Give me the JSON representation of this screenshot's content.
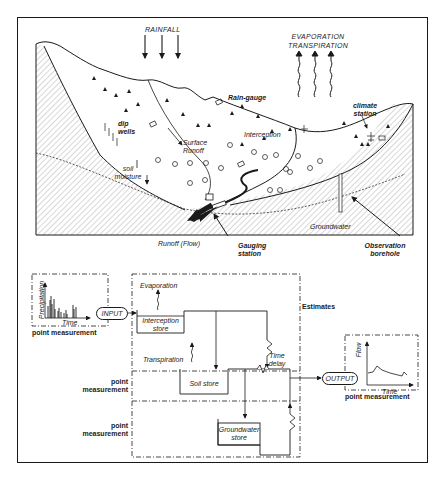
{
  "landscape": {
    "rainfall": "RAINFALL",
    "evaporation_line1": "EVAPORATION",
    "evaporation_line2": "TRANSPIRATION",
    "rain_gauge": "Rain-gauge",
    "climate_station_line1": "climate",
    "climate_station_line2": "station",
    "dip_wells_line1": "dip",
    "dip_wells_line2": "wells",
    "surface_runoff_line1": "Surface",
    "surface_runoff_line2": "Runoff",
    "interception": "Interception",
    "soil_moisture_line1": "soil",
    "soil_moisture_line2": "moisture",
    "groundwater": "Groundwater",
    "runoff_flow": "Runoff (Flow)",
    "gauging_station_line1": "Gauging",
    "gauging_station_line2": "station",
    "observation_borehole_line1": "Observation",
    "observation_borehole_line2": "borehole"
  },
  "model": {
    "input_panel": {
      "y_axis": "Precipitation",
      "x_axis": "Time",
      "caption": "point measurement"
    },
    "input_node": "INPUT",
    "estimates": "Estimates",
    "evaporation": "Evaporation",
    "interception_store_line1": "Interception",
    "interception_store_line2": "store",
    "transpiration": "Transpiration",
    "soil_store": "Soil store",
    "groundwater_store_line1": "Groundwater",
    "groundwater_store_line2": "store",
    "time_delay_line1": "Time",
    "time_delay_line2": "delay",
    "point_measurement_1_line1": "point",
    "point_measurement_1_line2": "measurement",
    "point_measurement_2_line1": "point",
    "point_measurement_2_line2": "measurement",
    "output_node": "OUTPUT",
    "output_panel": {
      "y_axis": "Flow",
      "x_axis": "Time",
      "caption": "point measurement"
    }
  },
  "colors": {
    "ink": "#1a1a1a",
    "paper": "#ffffff"
  }
}
